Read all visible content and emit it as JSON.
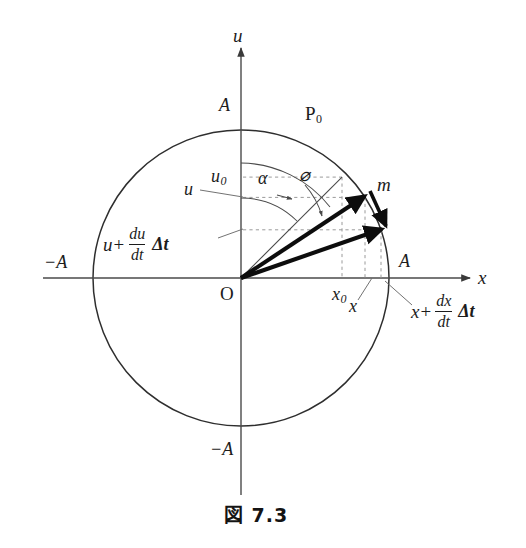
{
  "figure": {
    "caption": "図 7.3",
    "caption_label": "図",
    "caption_number": "7. 3"
  },
  "axes": {
    "x_axis_label": "x",
    "y_axis_label": "u",
    "origin_label": "O"
  },
  "ticks": {
    "amplitude_top": "A",
    "amplitude_bottom": "−A",
    "amplitude_left": "−A",
    "amplitude_right": "A"
  },
  "points": {
    "initial_point": "P",
    "initial_point_sub": "0",
    "mass_label": "m"
  },
  "angles": {
    "alpha": "α",
    "phi": "⌀"
  },
  "projections": {
    "u0": "u",
    "u0_sub": "0",
    "x0": "x",
    "x0_sub": "0",
    "u": "u",
    "x": "x"
  },
  "formulas": {
    "u_advanced": {
      "lead": "u",
      "plus": "+",
      "numerator": "du",
      "denominator": "dt",
      "trailing": "Δt"
    },
    "x_advanced": {
      "lead": "x",
      "plus": "+",
      "numerator": "dx",
      "denominator": "dt",
      "trailing": "Δt"
    }
  },
  "geometry": {
    "center_x": 241,
    "center_y": 278,
    "radius": 148,
    "p0_angle_deg": 47,
    "m_angle_deg": 33,
    "m2_angle_deg": 19
  },
  "colors": {
    "line": "#3a3a3a",
    "circle": "#2e2e2e",
    "vector": "#0d0d0d",
    "dashed": "#8a8a8a",
    "leader": "#555555",
    "text": "#1c1c1c",
    "background": "#ffffff"
  }
}
